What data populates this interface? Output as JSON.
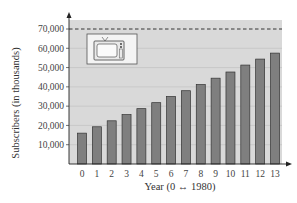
{
  "chart_data": {
    "type": "bar",
    "title": "",
    "xlabel": "Year (0 ↔ 1980)",
    "ylabel": "Subscribers (in thousands)",
    "categories": [
      "0",
      "1",
      "2",
      "3",
      "4",
      "5",
      "6",
      "7",
      "8",
      "9",
      "10",
      "11",
      "12",
      "13"
    ],
    "values": [
      16000,
      19300,
      22400,
      25600,
      28700,
      31800,
      35000,
      38000,
      41200,
      44500,
      47700,
      51300,
      54400,
      57500
    ],
    "ylim": [
      0,
      75000
    ],
    "yticks": [
      10000,
      20000,
      30000,
      40000,
      50000,
      60000,
      70000
    ],
    "ytick_labels": [
      "10,000",
      "20,000",
      "30,000",
      "40,000",
      "50,000",
      "60,000",
      "70,000"
    ],
    "reference_line": {
      "y": 70000,
      "style": "dashed"
    },
    "grid": true,
    "legend": null,
    "annotations": [
      "television-icon"
    ]
  },
  "colors": {
    "plot_bg": "#d9d9d9",
    "bar_fill": "#7f7f7f",
    "bar_edge": "#333333",
    "grid": "#bdbdbd"
  }
}
